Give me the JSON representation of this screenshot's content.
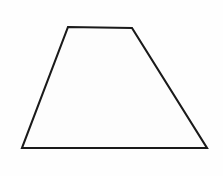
{
  "canvas": {
    "width": 223,
    "height": 176,
    "background_color": "#fefefe",
    "description": "Line drawing of a single geometric shape on a plain white background"
  },
  "figure": {
    "name": "trapezoid",
    "shape_type": "trapezoid",
    "label": "",
    "fill_color": "#fdfdfd",
    "stroke_color": "#1a1a1a",
    "stroke_width": 2.1,
    "vertices": [
      {
        "name": "top-left",
        "x": 68,
        "y": 27
      },
      {
        "name": "top-right",
        "x": 132,
        "y": 28
      },
      {
        "name": "bottom-right",
        "x": 207,
        "y": 148
      },
      {
        "name": "bottom-left",
        "x": 22,
        "y": 148
      }
    ],
    "points_attr": "68,27 132,28 207,148 22,148",
    "edges": [
      {
        "name": "top-edge",
        "from": "top-left",
        "to": "top-right"
      },
      {
        "name": "right-edge",
        "from": "top-right",
        "to": "bottom-right"
      },
      {
        "name": "bottom-edge",
        "from": "bottom-right",
        "to": "bottom-left"
      },
      {
        "name": "left-edge",
        "from": "bottom-left",
        "to": "top-left"
      }
    ]
  },
  "annotations": {
    "text_items": []
  }
}
